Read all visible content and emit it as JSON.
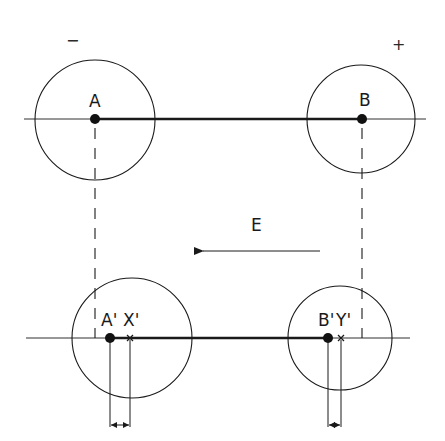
{
  "diagram": {
    "title": "",
    "signs": {
      "negative": "−",
      "positive": "+"
    },
    "top_row": {
      "point_a": {
        "label": "A"
      },
      "point_b": {
        "label": "B"
      }
    },
    "field": {
      "label": "E",
      "direction": "left"
    },
    "bottom_row": {
      "point_a_prime": {
        "label": "A'"
      },
      "point_x_prime": {
        "label": "X'"
      },
      "point_b_prime": {
        "label": "B'"
      },
      "point_y_prime": {
        "label": "Y'"
      }
    },
    "colors": {
      "stroke": "#1a1a1a",
      "background": "#ffffff"
    }
  }
}
